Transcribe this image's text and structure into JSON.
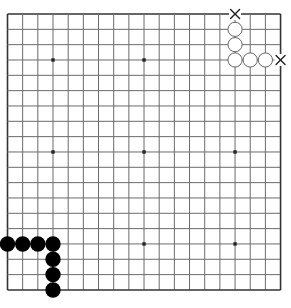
{
  "board": {
    "size": 19,
    "origin_x": 7.5,
    "origin_y": 14,
    "spacing_x": 15.17,
    "spacing_y": 15.33,
    "line_color": "#6b6b6b",
    "edge_color": "#333333",
    "background": "#ffffff"
  },
  "hoshi": [
    [
      3,
      3
    ],
    [
      9,
      3
    ],
    [
      3,
      9
    ],
    [
      9,
      9
    ],
    [
      15,
      9
    ],
    [
      3,
      15
    ],
    [
      9,
      15
    ],
    [
      15,
      15
    ]
  ],
  "stones": {
    "white": [
      [
        15,
        1
      ],
      [
        15,
        2
      ],
      [
        15,
        3
      ],
      [
        16,
        3
      ],
      [
        17,
        3
      ]
    ],
    "black": [
      [
        0,
        15
      ],
      [
        1,
        15
      ],
      [
        2,
        15
      ],
      [
        3,
        15
      ],
      [
        3,
        16
      ],
      [
        3,
        17
      ],
      [
        3,
        18
      ]
    ]
  },
  "marks": [
    {
      "type": "x",
      "col": 15,
      "row": 0
    },
    {
      "type": "x",
      "col": 18,
      "row": 3
    }
  ]
}
